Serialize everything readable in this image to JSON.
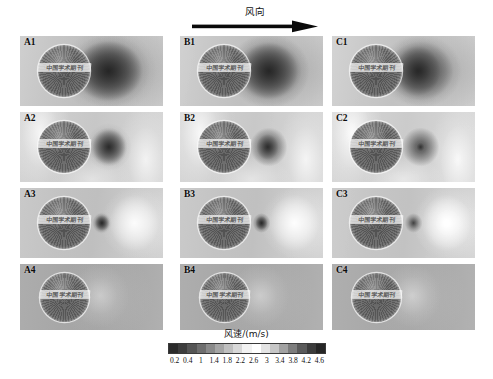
{
  "figure": {
    "wind_direction_label": "风向",
    "arrow_icon": "right-arrow-icon"
  },
  "panels": [
    {
      "id": "A1",
      "label": "A1",
      "row": 1,
      "column": "A",
      "watermark": "中国学术期刊",
      "wake_width_pct": 34,
      "wake_height_pct": 62,
      "wake_cx_pct": 62,
      "wake_darkness": 0.85
    },
    {
      "id": "B1",
      "label": "B1",
      "row": 1,
      "column": "B",
      "watermark": "中国学术期刊",
      "wake_width_pct": 28,
      "wake_height_pct": 56,
      "wake_cx_pct": 62,
      "wake_darkness": 0.82
    },
    {
      "id": "C1",
      "label": "C1",
      "row": 1,
      "column": "C",
      "watermark": "中国学术期刊",
      "wake_width_pct": 22,
      "wake_height_pct": 50,
      "wake_cx_pct": 60,
      "wake_darkness": 0.8
    },
    {
      "id": "A2",
      "label": "A2",
      "row": 2,
      "column": "A",
      "watermark": "中国学术期刊",
      "wake_width_pct": 16,
      "wake_height_pct": 34,
      "wake_cx_pct": 62,
      "wake_darkness": 0.8
    },
    {
      "id": "B2",
      "label": "B2",
      "row": 2,
      "column": "B",
      "watermark": "中国学术期刊",
      "wake_width_pct": 11,
      "wake_height_pct": 26,
      "wake_cx_pct": 61,
      "wake_darkness": 0.76
    },
    {
      "id": "C2",
      "label": "C2",
      "row": 2,
      "column": "C",
      "watermark": "中国学术期刊",
      "wake_width_pct": 4,
      "wake_height_pct": 9,
      "wake_cx_pct": 62,
      "wake_darkness": 0.58
    },
    {
      "id": "A3",
      "label": "A3",
      "row": 3,
      "column": "A",
      "watermark": "中国学术期刊",
      "wake_width_pct": 7,
      "wake_height_pct": 16,
      "wake_cx_pct": 57,
      "wake_darkness": 0.85
    },
    {
      "id": "B3",
      "label": "B3",
      "row": 3,
      "column": "B",
      "watermark": "中国学术期刊",
      "wake_width_pct": 6,
      "wake_height_pct": 14,
      "wake_cx_pct": 57,
      "wake_darkness": 0.82
    },
    {
      "id": "C3",
      "label": "C3",
      "row": 3,
      "column": "C",
      "watermark": "中国学术期刊",
      "wake_width_pct": 0,
      "wake_height_pct": 0,
      "wake_cx_pct": 57,
      "wake_darkness": 0.0
    },
    {
      "id": "A4",
      "label": "A4",
      "row": 4,
      "column": "A",
      "watermark": "中国学术期刊",
      "wake_width_pct": 0,
      "wake_height_pct": 0,
      "wake_cx_pct": 56,
      "wake_darkness": 0.0
    },
    {
      "id": "B4",
      "label": "B4",
      "row": 4,
      "column": "B",
      "watermark": "中国学术期刊",
      "wake_width_pct": 0,
      "wake_height_pct": 0,
      "wake_cx_pct": 56,
      "wake_darkness": 0.0
    },
    {
      "id": "C4",
      "label": "C4",
      "row": 4,
      "column": "C",
      "watermark": "中国学术期刊",
      "wake_width_pct": 0,
      "wake_height_pct": 0,
      "wake_cx_pct": 56,
      "wake_darkness": 0.0
    }
  ],
  "chart_data": {
    "type": "heatmap",
    "title": "风速/(m/s)",
    "subtitle": "",
    "xlabel": "",
    "ylabel": "",
    "colorbar_label": "风速/(m/s)",
    "colorbar_orientation": "horizontal",
    "colorbar_ticks": [
      0.2,
      0.4,
      1,
      1.4,
      1.8,
      2.2,
      2.6,
      3,
      3.4,
      3.8,
      4.2,
      4.6
    ],
    "colorbar_tick_labels": [
      "0.2",
      "0.4",
      "1",
      "1.4",
      "1.8",
      "2.2",
      "2.6",
      "3",
      "3.4",
      "3.8",
      "4.2",
      "4.6"
    ],
    "value_range": [
      0.2,
      4.6
    ],
    "units": "m/s",
    "colormap": "rainbow-grayscale",
    "colormap_stops": [
      "#2b2b2b",
      "#3d3d3d",
      "#555555",
      "#6e6e6e",
      "#8a8a8a",
      "#a5a5a5",
      "#bfbfbf",
      "#d8d8d8",
      "#f2f2f2",
      "#ffffff",
      "#e4e4e4",
      "#c6c6c6",
      "#a2a2a2",
      "#7d7d7d",
      "#5a5a5a",
      "#3c3c3c",
      "#262626"
    ],
    "grid": false,
    "legend_position": "bottom",
    "panel_rows": 4,
    "panel_columns": 3,
    "panel_ids": [
      [
        "A1",
        "B1",
        "C1"
      ],
      [
        "A2",
        "B2",
        "C2"
      ],
      [
        "A3",
        "B3",
        "C3"
      ],
      [
        "A4",
        "B4",
        "C4"
      ]
    ],
    "annotations": [
      {
        "text": "风向",
        "role": "wind-direction-label",
        "position": "top-center"
      }
    ]
  },
  "colorbar": {
    "title": "风速/(m/s)",
    "ticks": [
      "0.2",
      "0.4",
      "1",
      "1.4",
      "1.8",
      "2.2",
      "2.6",
      "3",
      "3.4",
      "3.8",
      "4.2",
      "4.6"
    ]
  }
}
